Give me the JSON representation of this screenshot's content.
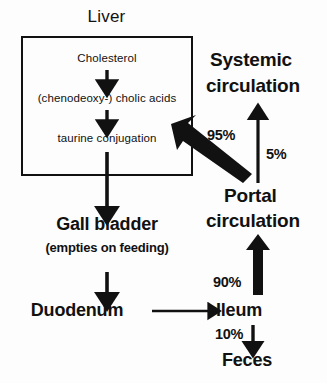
{
  "diagram": {
    "title_caption": "Liver",
    "liver_box": {
      "step1": "Cholesterol",
      "step2": "(chenodeoxy-) cholic acids",
      "step3": "taurine conjugation"
    },
    "nodes": {
      "gall_bladder": "Gall bladder",
      "gall_bladder_note": "(empties on feeding)",
      "duodenum": "Duodenum",
      "ileum": "Ileum",
      "feces": "Feces",
      "systemic_line1": "Systemic",
      "systemic_line2": "circulation",
      "portal_line1": "Portal",
      "portal_line2": "circulation"
    },
    "percentages": {
      "portal_to_liver": "95%",
      "portal_to_systemic": "5%",
      "ileum_to_portal": "90%",
      "ileum_to_feces": "10%"
    },
    "colors": {
      "ink": "#111111",
      "background": "#fdfdfd"
    }
  }
}
